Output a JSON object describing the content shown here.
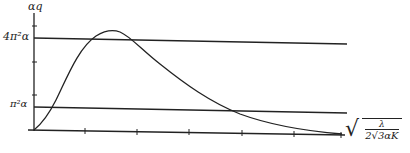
{
  "diagram": {
    "y_axis_label": "αq",
    "x_axis_label": {
      "radical": "√",
      "numerator": "λ",
      "denominator": "2√3αK",
      "full": "√(λ / (2√3αK))"
    },
    "y_tick_labels": {
      "upper": "4π²α",
      "lower": "π²α"
    },
    "horizontal_lines": [
      {
        "name": "upper-level-line",
        "label": "4π²α"
      },
      {
        "name": "lower-level-line",
        "label": "π²α"
      }
    ],
    "curve": {
      "description": "Curve rising from origin, peaking above 4π²α, then decaying toward the x-axis",
      "color": "#222222"
    },
    "x_tick_count": 6,
    "y_tick_count": 3,
    "line_color": "#222222"
  }
}
